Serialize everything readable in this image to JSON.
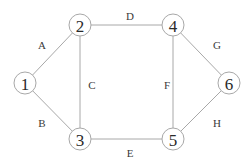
{
  "diagram": {
    "type": "undirected-graph",
    "nodes": [
      {
        "id": "1",
        "label": "1",
        "x": 25,
        "y": 83
      },
      {
        "id": "2",
        "label": "2",
        "x": 80,
        "y": 25
      },
      {
        "id": "3",
        "label": "3",
        "x": 80,
        "y": 139
      },
      {
        "id": "4",
        "label": "4",
        "x": 173,
        "y": 25
      },
      {
        "id": "5",
        "label": "5",
        "x": 173,
        "y": 139
      },
      {
        "id": "6",
        "label": "6",
        "x": 229,
        "y": 83
      }
    ],
    "edges": [
      {
        "id": "A",
        "label": "A",
        "from": "1",
        "to": "2",
        "lx": 42,
        "ly": 45
      },
      {
        "id": "B",
        "label": "B",
        "from": "1",
        "to": "3",
        "lx": 42,
        "ly": 123
      },
      {
        "id": "C",
        "label": "C",
        "from": "2",
        "to": "3",
        "lx": 92,
        "ly": 85
      },
      {
        "id": "D",
        "label": "D",
        "from": "2",
        "to": "4",
        "lx": 130,
        "ly": 16
      },
      {
        "id": "E",
        "label": "E",
        "from": "3",
        "to": "5",
        "lx": 130,
        "ly": 153
      },
      {
        "id": "F",
        "label": "F",
        "from": "4",
        "to": "5",
        "lx": 167,
        "ly": 85
      },
      {
        "id": "G",
        "label": "G",
        "from": "4",
        "to": "6",
        "lx": 217,
        "ly": 45
      },
      {
        "id": "H",
        "label": "H",
        "from": "5",
        "to": "6",
        "lx": 217,
        "ly": 123
      }
    ],
    "node_radius": 11,
    "colors": {
      "edge": "#a8a8a8",
      "node_stroke": "#a8a8a8",
      "text": "#2a2a2a"
    }
  }
}
